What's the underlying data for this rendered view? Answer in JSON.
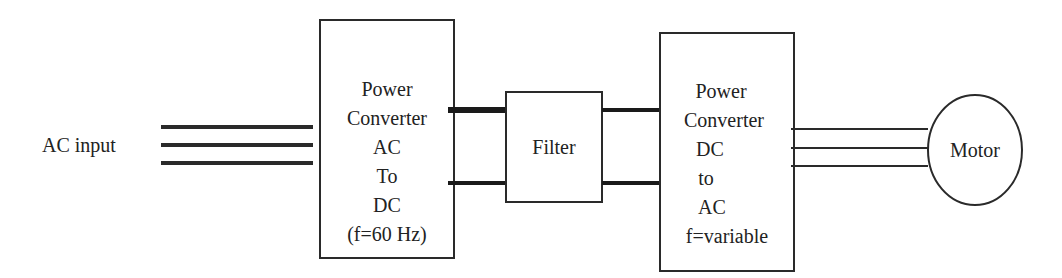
{
  "input": {
    "label": "AC input"
  },
  "blocks": [
    {
      "id": "rectifier",
      "lines": [
        "Power",
        "Converter",
        "AC",
        "To",
        "DC",
        "(f=60 Hz)"
      ]
    },
    {
      "id": "filter",
      "lines": [
        "Filter"
      ]
    },
    {
      "id": "inverter",
      "lines": [
        "Power",
        "Converter",
        "DC",
        "to",
        "AC",
        "f=variable"
      ]
    }
  ],
  "output": {
    "label": "Motor"
  },
  "colors": {
    "stroke": "#2a2a2a",
    "background": "#ffffff"
  }
}
